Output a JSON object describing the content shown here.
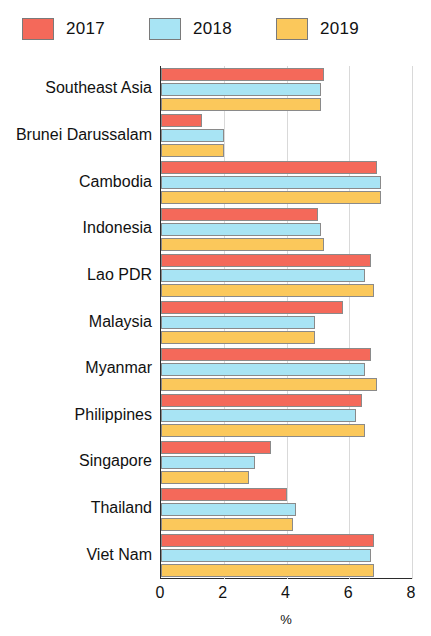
{
  "chart_data": {
    "type": "bar",
    "orientation": "horizontal",
    "title": "",
    "subtitle": "",
    "xlabel": "%",
    "ylabel": "",
    "xlim": [
      0,
      8
    ],
    "xticks": [
      0,
      2,
      4,
      6,
      8
    ],
    "grid": true,
    "legend_position": "top-left",
    "categories": [
      "Southeast Asia",
      "Brunei Darussalam",
      "Cambodia",
      "Indonesia",
      "Lao PDR",
      "Malaysia",
      "Myanmar",
      "Philippines",
      "Singapore",
      "Thailand",
      "Viet Nam"
    ],
    "series": [
      {
        "name": "2017",
        "color": "#f4695a",
        "values": [
          5.2,
          1.3,
          6.9,
          5.0,
          6.7,
          5.8,
          6.7,
          6.4,
          3.5,
          4.0,
          6.8
        ]
      },
      {
        "name": "2018",
        "color": "#a8e4f4",
        "values": [
          5.1,
          2.0,
          7.0,
          5.1,
          6.5,
          4.9,
          6.5,
          6.2,
          3.0,
          4.3,
          6.7
        ]
      },
      {
        "name": "2019",
        "color": "#fbc85b",
        "values": [
          5.1,
          2.0,
          7.0,
          5.2,
          6.8,
          4.9,
          6.9,
          6.5,
          2.8,
          4.2,
          6.8
        ]
      }
    ]
  },
  "legend": {
    "items": [
      {
        "label": "2017",
        "color": "#f4695a"
      },
      {
        "label": "2018",
        "color": "#a8e4f4"
      },
      {
        "label": "2019",
        "color": "#fbc85b"
      }
    ]
  },
  "axis": {
    "x_title": "%",
    "tick_labels": [
      "0",
      "2",
      "4",
      "6",
      "8"
    ]
  }
}
